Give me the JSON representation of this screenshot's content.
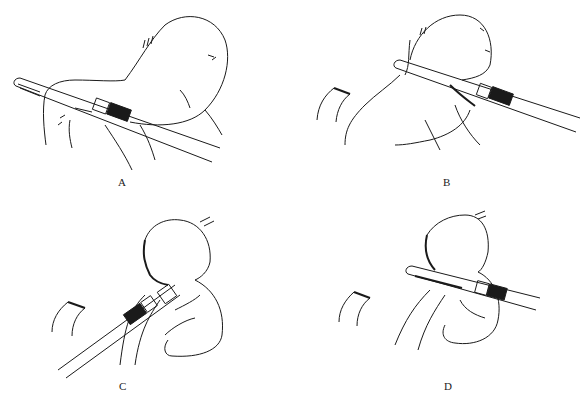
{
  "figure": {
    "panels": [
      {
        "id": "A",
        "label": "A",
        "description": "Stapler placed along lesser curvature of stomach"
      },
      {
        "id": "B",
        "label": "B",
        "description": "Stapler advanced toward fundus"
      },
      {
        "id": "C",
        "label": "C",
        "description": "Staple line along stomach, stapler fired"
      },
      {
        "id": "D",
        "label": "D",
        "description": "Stapler reapplied to complete gastric transection"
      }
    ],
    "colors": {
      "line": "#1a1a1a",
      "background": "#ffffff"
    }
  }
}
